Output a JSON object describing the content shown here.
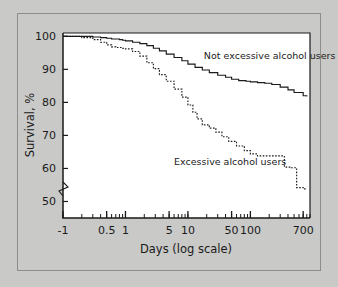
{
  "figure": {
    "background_color": "#c9c9c7",
    "plot_background_color": "#ffffff",
    "axis_color": "#1a1a1a",
    "frame_border_color": "#8d8d8b"
  },
  "chart_data": {
    "type": "line",
    "title": "",
    "subtitle": "",
    "xlabel": "Days (log scale)",
    "ylabel": "Survival, %",
    "xscale": "log",
    "yscale": "linear",
    "ylim": [
      45,
      101
    ],
    "xlim_days": [
      0.1,
      900
    ],
    "grid": false,
    "legend_position": "inline-annotation",
    "y_axis_break": true,
    "y_axis_break_note": "zigzag break on y-axis below 50",
    "xtick_labels": [
      "-1",
      "0.5",
      "1",
      "5",
      "10",
      "50",
      "100",
      "700"
    ],
    "xtick_values": [
      0.1,
      0.5,
      1,
      5,
      10,
      50,
      100,
      700
    ],
    "ytick_labels": [
      "50",
      "60",
      "70",
      "80",
      "90",
      "100"
    ],
    "ytick_values": [
      50,
      60,
      70,
      80,
      90,
      100
    ],
    "annotations": [
      {
        "text": "Not excessive alcohol users",
        "x_days": 18,
        "y": 93
      },
      {
        "text": "Excessive alcohol users",
        "x_days": 6,
        "y": 61
      }
    ],
    "series": [
      {
        "name": "Not excessive alcohol users",
        "style": "solid-step",
        "x": [
          0.1,
          0.2,
          0.3,
          0.4,
          0.5,
          0.6,
          0.7,
          0.8,
          0.9,
          1,
          1.3,
          1.7,
          2.2,
          2.8,
          3.5,
          4.5,
          6,
          8,
          10,
          13,
          17,
          22,
          30,
          40,
          50,
          65,
          85,
          100,
          130,
          170,
          220,
          300,
          400,
          500,
          700,
          800
        ],
        "values": [
          100,
          100,
          99.8,
          99.6,
          99.4,
          99.2,
          99.2,
          99.0,
          98.8,
          98.6,
          98.2,
          97.8,
          97.2,
          96.4,
          95.6,
          94.6,
          93.6,
          92.6,
          91.6,
          90.6,
          89.8,
          89.0,
          88.2,
          87.6,
          87.0,
          86.6,
          86.4,
          86.2,
          86.0,
          85.8,
          85.4,
          84.6,
          83.8,
          83.0,
          82.0,
          81.8
        ]
      },
      {
        "name": "Excessive alcohol users",
        "style": "dotted-step",
        "x": [
          0.1,
          0.2,
          0.3,
          0.4,
          0.5,
          0.6,
          0.7,
          0.8,
          0.9,
          1,
          1.3,
          1.7,
          2.2,
          2.8,
          3.5,
          4.5,
          6,
          8,
          10,
          12,
          14,
          17,
          22,
          28,
          35,
          45,
          60,
          80,
          100,
          130,
          170,
          220,
          280,
          350,
          450,
          550,
          700,
          800
        ],
        "values": [
          100,
          99.6,
          99.0,
          98.2,
          97.4,
          96.8,
          96.6,
          96.6,
          96.4,
          96.2,
          95.4,
          94.0,
          92.0,
          90.2,
          88.4,
          86.4,
          84.0,
          81.6,
          79.2,
          77.0,
          75.0,
          73.2,
          72.2,
          71.0,
          69.6,
          68.2,
          66.8,
          65.4,
          64.4,
          63.8,
          63.8,
          63.8,
          63.8,
          60.4,
          60.2,
          54.2,
          53.8,
          53.8
        ]
      }
    ]
  },
  "axes": {
    "y_title": "Survival, %",
    "x_title": "Days (log scale)"
  }
}
